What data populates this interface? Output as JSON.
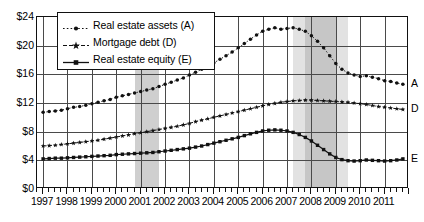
{
  "chart_data": {
    "type": "line",
    "title": "",
    "xlabel": "",
    "ylabel": "",
    "ylim": [
      0,
      24
    ],
    "xlim": [
      1996.75,
      2012.0
    ],
    "grid": true,
    "y_ticks": [
      "$0",
      "$4",
      "$8",
      "$12",
      "$16",
      "$20",
      "$24"
    ],
    "y_tick_values": [
      0,
      4,
      8,
      12,
      16,
      20,
      24
    ],
    "x_ticks": [
      "1997",
      "1998",
      "1999",
      "2000",
      "2001",
      "2002",
      "2003",
      "2004",
      "2005",
      "2006",
      "2007",
      "2008",
      "2009",
      "2010",
      "2011"
    ],
    "x_tick_values": [
      1997,
      1998,
      1999,
      2000,
      2001,
      2002,
      2003,
      2004,
      2005,
      2006,
      2007,
      2008,
      2009,
      2010,
      2011
    ],
    "minor_tick_interval": 0.25,
    "legend_position": "upper-left",
    "units": "trillions of dollars",
    "series": [
      {
        "name": "Real estate assets (A)",
        "key": "A",
        "end_label": "A",
        "marker": "dot",
        "line_style": "dotted",
        "color": "#111111",
        "x": [
          1997.0,
          1997.25,
          1997.5,
          1997.75,
          1998.0,
          1998.25,
          1998.5,
          1998.75,
          1999.0,
          1999.25,
          1999.5,
          1999.75,
          2000.0,
          2000.25,
          2000.5,
          2000.75,
          2001.0,
          2001.25,
          2001.5,
          2001.75,
          2002.0,
          2002.25,
          2002.5,
          2002.75,
          2003.0,
          2003.25,
          2003.5,
          2003.75,
          2004.0,
          2004.25,
          2004.5,
          2004.75,
          2005.0,
          2005.25,
          2005.5,
          2005.75,
          2006.0,
          2006.25,
          2006.5,
          2006.75,
          2007.0,
          2007.25,
          2007.5,
          2007.75,
          2008.0,
          2008.25,
          2008.5,
          2008.75,
          2009.0,
          2009.25,
          2009.5,
          2009.75,
          2010.0,
          2010.25,
          2010.5,
          2010.75,
          2011.0,
          2011.25,
          2011.5,
          2011.75
        ],
        "y": [
          10.7,
          10.8,
          10.9,
          11.0,
          11.2,
          11.4,
          11.5,
          11.7,
          11.9,
          12.1,
          12.3,
          12.5,
          12.8,
          13.0,
          13.2,
          13.4,
          13.6,
          13.8,
          14.0,
          14.3,
          14.6,
          14.9,
          15.2,
          15.5,
          15.9,
          16.3,
          16.7,
          17.1,
          17.6,
          18.1,
          18.6,
          19.1,
          19.7,
          20.3,
          20.9,
          21.5,
          22.0,
          22.3,
          22.5,
          22.3,
          22.4,
          22.5,
          22.3,
          22.0,
          21.4,
          20.6,
          19.7,
          18.6,
          17.5,
          16.7,
          16.2,
          15.9,
          15.7,
          15.8,
          15.6,
          15.4,
          15.1,
          15.0,
          14.8,
          14.6
        ]
      },
      {
        "name": "Mortgage debt (D)",
        "key": "D",
        "end_label": "D",
        "marker": "star",
        "line_style": "dashed",
        "color": "#111111",
        "x": [
          1997.0,
          1997.25,
          1997.5,
          1997.75,
          1998.0,
          1998.25,
          1998.5,
          1998.75,
          1999.0,
          1999.25,
          1999.5,
          1999.75,
          2000.0,
          2000.25,
          2000.5,
          2000.75,
          2001.0,
          2001.25,
          2001.5,
          2001.75,
          2002.0,
          2002.25,
          2002.5,
          2002.75,
          2003.0,
          2003.25,
          2003.5,
          2003.75,
          2004.0,
          2004.25,
          2004.5,
          2004.75,
          2005.0,
          2005.25,
          2005.5,
          2005.75,
          2006.0,
          2006.25,
          2006.5,
          2006.75,
          2007.0,
          2007.25,
          2007.5,
          2007.75,
          2008.0,
          2008.25,
          2008.5,
          2008.75,
          2009.0,
          2009.25,
          2009.5,
          2009.75,
          2010.0,
          2010.25,
          2010.5,
          2010.75,
          2011.0,
          2011.25,
          2011.5,
          2011.75
        ],
        "y": [
          6.0,
          6.05,
          6.1,
          6.2,
          6.3,
          6.4,
          6.5,
          6.6,
          6.7,
          6.8,
          6.95,
          7.1,
          7.25,
          7.4,
          7.55,
          7.7,
          7.85,
          8.0,
          8.15,
          8.3,
          8.45,
          8.6,
          8.75,
          8.95,
          9.15,
          9.4,
          9.6,
          9.8,
          10.0,
          10.2,
          10.4,
          10.6,
          10.8,
          11.0,
          11.2,
          11.4,
          11.6,
          11.8,
          11.95,
          12.1,
          12.2,
          12.3,
          12.35,
          12.4,
          12.4,
          12.35,
          12.3,
          12.25,
          12.2,
          12.15,
          12.1,
          12.0,
          11.9,
          11.8,
          11.65,
          11.5,
          11.4,
          11.3,
          11.2,
          11.1
        ]
      },
      {
        "name": "Real estate equity (E)",
        "key": "E",
        "end_label": "E",
        "marker": "square",
        "line_style": "solid",
        "color": "#111111",
        "x": [
          1997.0,
          1997.25,
          1997.5,
          1997.75,
          1998.0,
          1998.25,
          1998.5,
          1998.75,
          1999.0,
          1999.25,
          1999.5,
          1999.75,
          2000.0,
          2000.25,
          2000.5,
          2000.75,
          2001.0,
          2001.25,
          2001.5,
          2001.75,
          2002.0,
          2002.25,
          2002.5,
          2002.75,
          2003.0,
          2003.25,
          2003.5,
          2003.75,
          2004.0,
          2004.25,
          2004.5,
          2004.75,
          2005.0,
          2005.25,
          2005.5,
          2005.75,
          2006.0,
          2006.25,
          2006.5,
          2006.75,
          2007.0,
          2007.25,
          2007.5,
          2007.75,
          2008.0,
          2008.25,
          2008.5,
          2008.75,
          2009.0,
          2009.25,
          2009.5,
          2009.75,
          2010.0,
          2010.25,
          2010.5,
          2010.75,
          2011.0,
          2011.25,
          2011.5,
          2011.75
        ],
        "y": [
          4.2,
          4.25,
          4.3,
          4.3,
          4.35,
          4.4,
          4.45,
          4.5,
          4.55,
          4.6,
          4.65,
          4.7,
          4.8,
          4.85,
          4.9,
          4.95,
          5.0,
          5.05,
          5.1,
          5.2,
          5.3,
          5.4,
          5.5,
          5.6,
          5.7,
          5.85,
          6.0,
          6.2,
          6.4,
          6.6,
          6.8,
          7.0,
          7.2,
          7.45,
          7.7,
          7.9,
          8.1,
          8.2,
          8.25,
          8.2,
          8.1,
          7.9,
          7.6,
          7.2,
          6.7,
          6.1,
          5.5,
          4.9,
          4.4,
          4.1,
          3.95,
          3.9,
          3.95,
          4.05,
          4.0,
          3.95,
          3.9,
          3.95,
          4.05,
          4.2
        ]
      }
    ],
    "shaded_regions": [
      {
        "name": "recession-2001",
        "start": 2000.75,
        "end": 2001.75,
        "color": "#cfcfcf",
        "label": "recession"
      },
      {
        "name": "recession-2007-outer",
        "start": 2007.25,
        "end": 2009.5,
        "color": "#e2e2e2",
        "label": "recession-outer"
      },
      {
        "name": "recession-2007-inner",
        "start": 2007.75,
        "end": 2009.0,
        "color": "#c6c6c6",
        "label": "recession-inner"
      }
    ]
  }
}
